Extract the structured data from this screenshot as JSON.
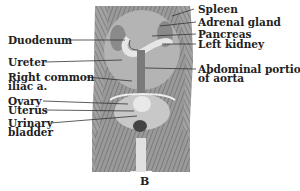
{
  "figure": {
    "caption": "B",
    "labels_left": [
      {
        "text": "Duodenum"
      },
      {
        "text": "Ureter"
      },
      {
        "text": "Right common"
      },
      {
        "text": "iliac a."
      },
      {
        "text": "Ovary"
      },
      {
        "text": "Uterus"
      },
      {
        "text": "Urinary"
      },
      {
        "text": "bladder"
      }
    ],
    "labels_right": [
      {
        "text": "Spleen"
      },
      {
        "text": "Adrenal gland"
      },
      {
        "text": "Pancreas"
      },
      {
        "text": "Left kidney"
      },
      {
        "text": "Abdominal portion"
      },
      {
        "text": "of aorta"
      }
    ]
  }
}
